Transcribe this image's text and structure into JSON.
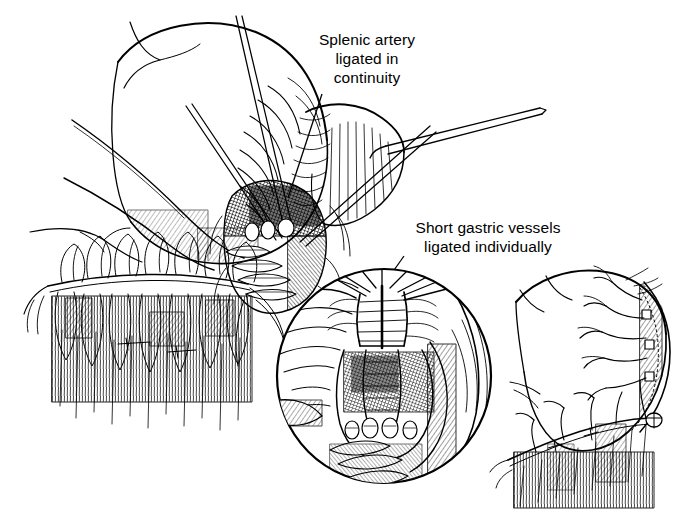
{
  "figure": {
    "kind": "surgical-line-illustration",
    "technique": "pen-and-ink cross-hatching",
    "background_color": "#ffffff",
    "ink_color": "#000000",
    "width": 700,
    "height": 521
  },
  "labels": {
    "splenic_artery": {
      "line1": "Splenic artery",
      "line2": "ligated in",
      "line3": "continuity",
      "text": "Splenic artery\nligated in\ncontinuity"
    },
    "short_gastric": {
      "line1": "Short gastric vessels",
      "line2": "ligated individually",
      "text": "Short gastric vessels\nligated individually"
    }
  },
  "panels": {
    "main": {
      "name": "main-operative-field",
      "description": "Stomach retracted upward with splenic artery exposed, instruments and ligatures in the lesser sac"
    },
    "inset": {
      "name": "circular-inset-detail",
      "description": "Magnified circular detail of short gastric vessels being ligated individually",
      "center_x": 384,
      "center_y": 376,
      "radius": 109
    },
    "right": {
      "name": "completed-devascularization",
      "description": "Stomach after ligation showing tied short gastric and gastroepiploic vessels"
    }
  },
  "leaders": {
    "splenic_leader": "leader-line-splenic-artery",
    "short_gastric_leader": "leader-line-short-gastric"
  }
}
